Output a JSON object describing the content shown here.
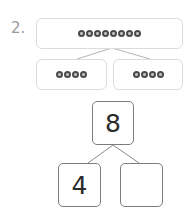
{
  "problem": {
    "number_label": "2.",
    "counters": {
      "whole_count": 8,
      "left_part_count": 4,
      "right_part_count": 4,
      "counter_icon": "flower-counter-icon"
    },
    "number_bond": {
      "whole": "8",
      "left_part": "4",
      "right_part": ""
    }
  }
}
